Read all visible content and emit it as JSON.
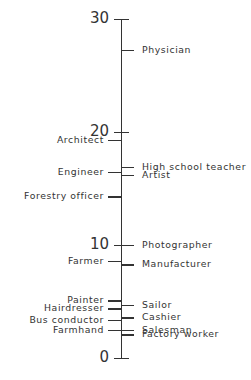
{
  "chart_data": {
    "type": "scale",
    "title": "",
    "axis": {
      "min": 0,
      "max": 30,
      "ticks": [
        0,
        10,
        20,
        30
      ],
      "orientation": "vertical"
    },
    "left_items": [
      {
        "label": "Architect",
        "value": 19.3
      },
      {
        "label": "Engineer",
        "value": 16.5
      },
      {
        "label": "Forestry officer",
        "value": 14.3
      },
      {
        "label": "Farmer",
        "value": 8.6
      },
      {
        "label": "Painter",
        "value": 5.1
      },
      {
        "label": "Hairdresser",
        "value": 4.4
      },
      {
        "label": "Bus conductor",
        "value": 3.4
      },
      {
        "label": "Farmhand",
        "value": 2.5
      }
    ],
    "right_items": [
      {
        "label": "Physician",
        "value": 27.3
      },
      {
        "label": "High school teacher",
        "value": 16.9
      },
      {
        "label": "Artist",
        "value": 16.2
      },
      {
        "label": "Photographer",
        "value": 10.0
      },
      {
        "label": "Manufacturer",
        "value": 8.3
      },
      {
        "label": "Sailor",
        "value": 4.7
      },
      {
        "label": "Cashier",
        "value": 3.6
      },
      {
        "label": "Salesman",
        "value": 2.5
      },
      {
        "label": "Factory worker",
        "value": 2.1
      }
    ]
  },
  "layout": {
    "axis_x": 121,
    "y_top": 19,
    "y_bottom": 358
  }
}
